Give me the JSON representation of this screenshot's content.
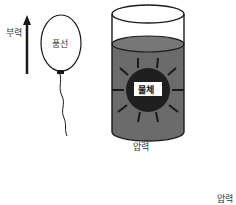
{
  "diagram": {
    "balloon": {
      "force_label": "부력",
      "balloon_label": "풍선"
    },
    "cylinder": {
      "object_label": "물체",
      "pressure_label": "압력"
    },
    "corner_label": "압력",
    "colors": {
      "line": "#1a1a1a",
      "fluid": "#6b6b6b",
      "object": "#1f1f1f",
      "label_bg": "#ffffff"
    }
  }
}
